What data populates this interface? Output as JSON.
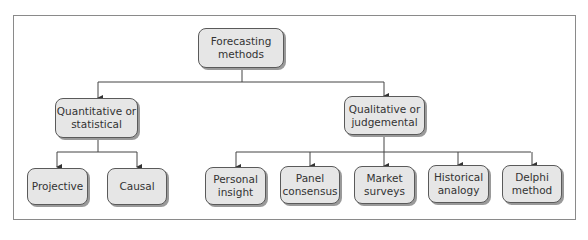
{
  "diagram": {
    "type": "hierarchy",
    "root": {
      "label": "Forecasting\nmethods",
      "children": [
        {
          "label": "Quantitative or\nstatistical",
          "children": [
            {
              "label": "Projective"
            },
            {
              "label": "Causal"
            }
          ]
        },
        {
          "label": "Qualitative or\njudgemental",
          "children": [
            {
              "label": "Personal\ninsight"
            },
            {
              "label": "Panel\nconsensus"
            },
            {
              "label": "Market\nsurveys"
            },
            {
              "label": "Historical\nanalogy"
            },
            {
              "label": "Delphi\nmethod"
            }
          ]
        }
      ]
    }
  },
  "colors": {
    "node_fill": "#e6e6e6",
    "node_border": "#5a5a5a",
    "shadow": "#9a9a9a",
    "line": "#444444",
    "frame": "#8a8a8a"
  }
}
